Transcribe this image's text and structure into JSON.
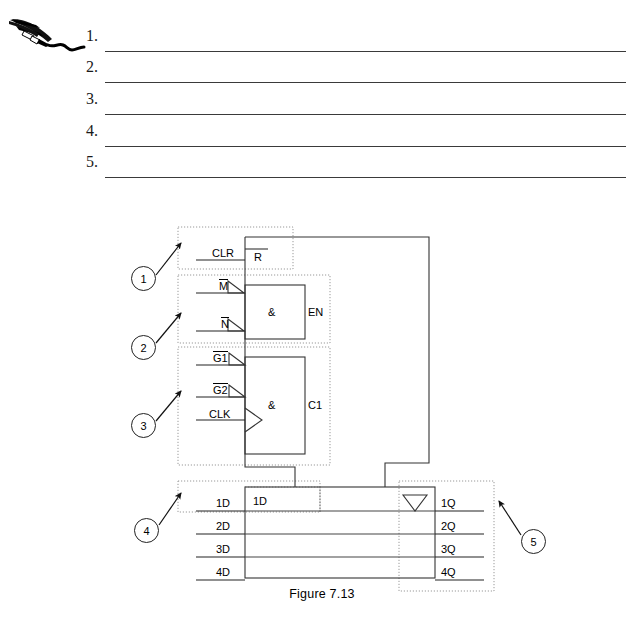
{
  "worksheet": {
    "icon": "quill-pen-icon",
    "items": [
      {
        "number": "1."
      },
      {
        "number": "2."
      },
      {
        "number": "3."
      },
      {
        "number": "4."
      },
      {
        "number": "5."
      }
    ]
  },
  "figure": {
    "caption": "Figure 7.13",
    "callouts": [
      {
        "id": "1",
        "label": "1"
      },
      {
        "id": "2",
        "label": "2"
      },
      {
        "id": "3",
        "label": "3"
      },
      {
        "id": "4",
        "label": "4"
      },
      {
        "id": "5",
        "label": "5"
      }
    ],
    "control_block": {
      "reset": {
        "input_label": "CLR",
        "pin_label": "R"
      },
      "enable_gate": {
        "inputs": [
          "M",
          "N"
        ],
        "gate_symbol": "&",
        "output_label": "EN"
      },
      "clock_gate": {
        "inputs": [
          "G1",
          "G2",
          "CLK"
        ],
        "gate_symbol": "&",
        "output_label": "C1"
      }
    },
    "register_block": {
      "first_cell_label": "1D",
      "dynamic_indicator": "triangle-down-icon",
      "data_inputs": [
        "1D",
        "2D",
        "3D",
        "4D"
      ],
      "data_outputs": [
        "1Q",
        "2Q",
        "3Q",
        "4Q"
      ]
    }
  }
}
